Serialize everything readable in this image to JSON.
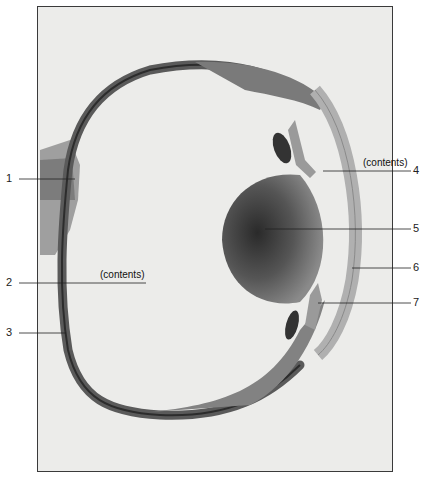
{
  "figure": {
    "type": "histology-section",
    "frame_color": "#3a3a3a",
    "background_color": "#ececea"
  },
  "labels": [
    {
      "number": "1",
      "side": "left",
      "y": 179
    },
    {
      "number": "2",
      "side": "left",
      "y": 283,
      "inline_text": "(contents)"
    },
    {
      "number": "3",
      "side": "left",
      "y": 333
    },
    {
      "number": "4",
      "side": "right",
      "y": 171,
      "inline_text": "(contents)"
    },
    {
      "number": "5",
      "side": "right",
      "y": 229
    },
    {
      "number": "6",
      "side": "right",
      "y": 268
    },
    {
      "number": "7",
      "side": "right",
      "y": 303
    }
  ],
  "annotations": {
    "vitreous_contents": "(contents)",
    "anterior_chamber_contents": "(contents)"
  }
}
